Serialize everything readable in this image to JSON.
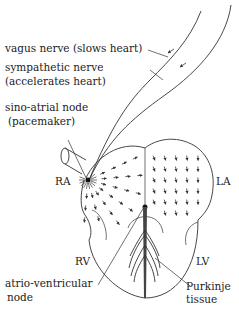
{
  "labels": {
    "vagus": "vagus nerve (slows heart)",
    "sympathetic_1": "sympathetic nerve",
    "sympathetic_2": "(accelerates heart)",
    "sa_1": "sino-atrial node",
    "sa_2": "(pacemaker)",
    "ra": "RA",
    "la": "LA",
    "rv": "RV",
    "lv": "LV",
    "av_1": "atrio-ventricular",
    "av_2": "node",
    "purkinje_1": "Purkinje",
    "purkinje_2": "tissue"
  },
  "colors": {
    "line": "#333333",
    "text": "#222222",
    "background": "#ffffff"
  }
}
